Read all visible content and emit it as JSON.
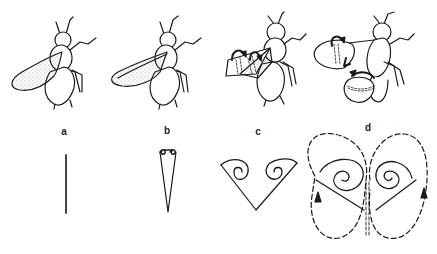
{
  "figure": {
    "panels": [
      {
        "label": "a",
        "x": 64,
        "description": "Wings clapped together (dorsal)",
        "section": "wings closed as a single line"
      },
      {
        "label": "b",
        "x": 167,
        "description": "Wings beginning to fling apart",
        "section": "narrow V with small leading-edge vortices"
      },
      {
        "label": "c",
        "x": 258,
        "description": "Wings flung open with rotation arrows",
        "section": "wide V with two bound vortices"
      },
      {
        "label": "d",
        "x": 368,
        "description": "Wings fully separated, downstroke",
        "section": "opposite vortices with dashed circulation loops and arrows"
      }
    ],
    "colors": {
      "ink": "#1a1a1a",
      "background": "#ffffff"
    }
  }
}
